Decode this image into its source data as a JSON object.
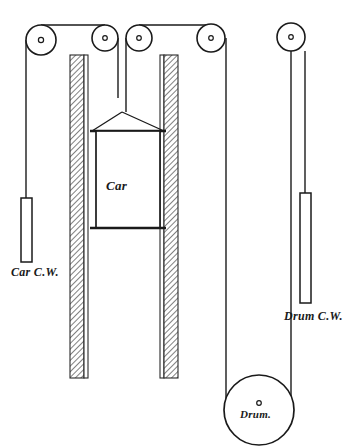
{
  "figure": {
    "background_color": "#ffffff",
    "line_color": "#1a1a1a",
    "hatch_color": "#555555",
    "width": 354,
    "height": 447
  },
  "labels": {
    "car": "Car",
    "car_counterweight": "Car C.W.",
    "drum_counterweight": "Drum C.W.",
    "drum": "Drum."
  },
  "components": {
    "sheaves": [
      {
        "name": "sheave-1",
        "cx": 41,
        "cy": 40,
        "r": 15,
        "hub_r": 3
      },
      {
        "name": "sheave-2",
        "cx": 105,
        "cy": 38,
        "r": 13,
        "hub_r": 2.5
      },
      {
        "name": "sheave-3",
        "cx": 139,
        "cy": 38,
        "r": 13,
        "hub_r": 2.5
      },
      {
        "name": "sheave-4",
        "cx": 211,
        "cy": 38,
        "r": 14,
        "hub_r": 2.5
      },
      {
        "name": "sheave-5",
        "cx": 291,
        "cy": 37,
        "r": 14,
        "hub_r": 2.5
      }
    ],
    "drum": {
      "name": "drum",
      "cx": 259,
      "cy": 410,
      "r": 35,
      "hub_r": 2.5
    },
    "guide_rails": [
      {
        "name": "guide-rail-left",
        "x": 70,
        "y": 55,
        "width": 18,
        "height": 323
      },
      {
        "name": "guide-rail-right",
        "x": 160,
        "y": 55,
        "width": 18,
        "height": 323
      }
    ],
    "car_body": {
      "x": 96,
      "y": 131,
      "width": 64,
      "height": 97
    },
    "car_crosshead": {
      "x1": 92,
      "y1": 131,
      "x2": 164,
      "y2": 131
    },
    "car_bottom_beam": {
      "x1": 92,
      "y1": 228,
      "x2": 164,
      "y2": 228
    },
    "car_counterweight_block": {
      "x": 24,
      "y": 198,
      "width": 10,
      "height": 64
    },
    "drum_counterweight_block": {
      "x": 300,
      "y": 193,
      "width": 11,
      "height": 110
    }
  },
  "ropes": {
    "car_hitch_apex": {
      "x": 128,
      "y": 112
    },
    "car_hoist_rope": {
      "x": 128,
      "y_top": 38,
      "y_bottom": 112
    },
    "car_cw_rope": {
      "x": 29,
      "y_top": 40,
      "y_bottom": 198
    },
    "top_rope_left_span": {
      "x1": 41,
      "y1": 25,
      "x2": 105,
      "y2": 25
    },
    "top_rope_right_span": {
      "x1": 139,
      "y1": 25,
      "x2": 211,
      "y2": 25
    },
    "drum_rope_left": {
      "x": 226,
      "y_top": 38,
      "y_bottom": 406
    },
    "drum_rope_right": {
      "x": 291,
      "y_top": 37,
      "y_bottom": 406
    },
    "drum_cw_rope": {
      "x": 305,
      "y_top": 51,
      "y_bottom": 193
    }
  },
  "label_positions": {
    "car": {
      "x": 106,
      "y": 188
    },
    "car_counterweight": {
      "x": 12,
      "y": 274
    },
    "drum_counterweight": {
      "x": 281,
      "y": 318
    },
    "drum": {
      "x": 241,
      "y": 416
    }
  }
}
